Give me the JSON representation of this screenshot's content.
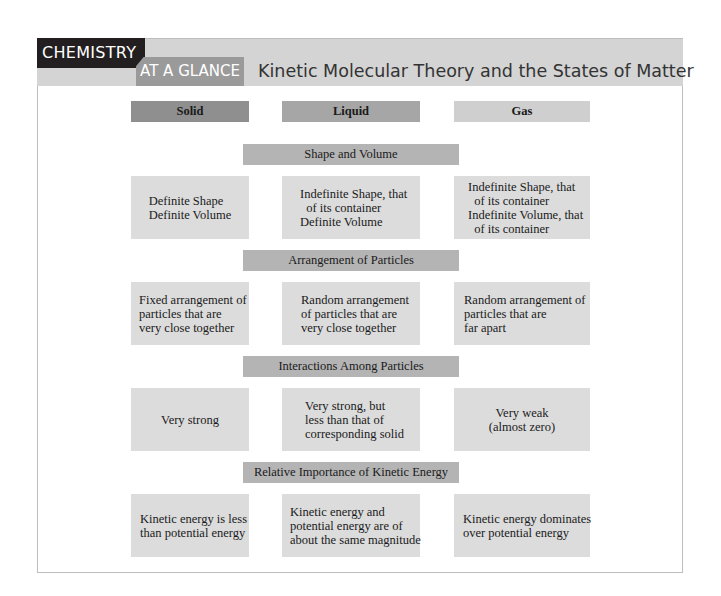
{
  "header": {
    "badge": "CHEMISTRY",
    "subbadge": "AT A GLANCE",
    "title": "Kinetic Molecular Theory and the States of Matter"
  },
  "columns": [
    {
      "label": "Solid",
      "color": "#8f8f8f"
    },
    {
      "label": "Liquid",
      "color": "#a6a6a6"
    },
    {
      "label": "Gas",
      "color": "#cfcfcf"
    }
  ],
  "sections": [
    {
      "title": "Shape and Volume",
      "cells": [
        "Definite Shape\nDefinite Volume",
        "Indefinite Shape, that\n  of its container\nDefinite Volume",
        "Indefinite Shape, that\n  of its container\nIndefinite Volume, that\n  of its container"
      ]
    },
    {
      "title": "Arrangement of Particles",
      "cells": [
        "Fixed arrangement of\nparticles that are\nvery close together",
        "Random arrangement\nof particles that are\nvery close together",
        "Random arrangement of\nparticles that are\nfar apart"
      ]
    },
    {
      "title": "Interactions Among Particles",
      "cells": [
        "Very strong",
        "Very strong, but\nless than that of\ncorresponding solid",
        "Very weak\n(almost zero)"
      ]
    },
    {
      "title": "Relative Importance of Kinetic Energy",
      "cells": [
        "Kinetic energy is less\nthan potential energy",
        "Kinetic energy and\npotential energy are of\nabout the same magnitude",
        "Kinetic energy dominates\nover potential energy"
      ]
    }
  ],
  "colors": {
    "badge_bg": "#231f20",
    "band_bg": "#d4d4d4",
    "subbadge_bg": "#9a9a9a",
    "section_bar_bg": "#b4b4b4",
    "cell_bg": "#dcdcdc"
  }
}
